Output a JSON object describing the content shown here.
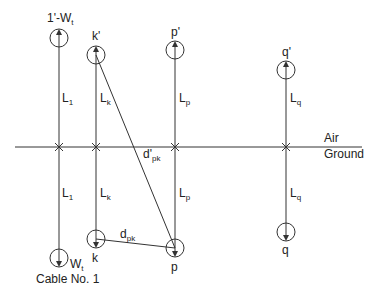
{
  "diagram": {
    "labels": {
      "cable1_image": "1'-W",
      "cable1_image_sub": "t",
      "cable1_bottom": "W",
      "cable1_bottom_sub": "t",
      "cable1_name": "Cable No. 1",
      "k_image": "k'",
      "k": "k",
      "p_image": "p'",
      "p": "p",
      "q_image": "q'",
      "q": "q",
      "L1_top": "L",
      "L1_top_sub": "1",
      "L1_bottom": "L",
      "L1_bottom_sub": "1",
      "Lk_top": "L",
      "Lk_top_sub": "k",
      "Lk_bottom": "L",
      "Lk_bottom_sub": "k",
      "Lp_top": "L",
      "Lp_top_sub": "p",
      "Lp_bottom": "L",
      "Lp_bottom_sub": "p",
      "Lq_top": "L",
      "Lq_top_sub": "q",
      "Lq_bottom": "L",
      "Lq_bottom_sub": "q",
      "d_prime_pk": "d'",
      "d_prime_pk_sub": "pk",
      "d_pk": "d",
      "d_pk_sub": "pk",
      "air": "Air",
      "ground": "Ground"
    },
    "colors": {
      "line": "#333333",
      "text": "#222222"
    }
  }
}
